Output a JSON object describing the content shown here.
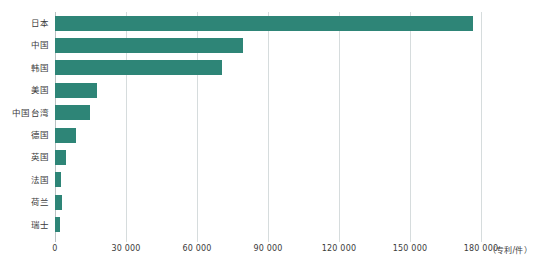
{
  "chart_data": {
    "type": "bar",
    "orientation": "horizontal",
    "title": "",
    "xlabel": "",
    "ylabel": "",
    "unit_label": "（专利/件）",
    "xlim": [
      0,
      180000
    ],
    "grid": true,
    "legend": false,
    "bar_color": "#2e8577",
    "gridline_color": "#d6dcdd",
    "axis_color": "#b9c1c2",
    "text_color": "#3b3b3b",
    "xticks": [
      0,
      30000,
      60000,
      90000,
      120000,
      150000,
      180000
    ],
    "xtick_labels": [
      "0",
      "30 000",
      "60 000",
      "90 000",
      "120 000",
      "150 000",
      "180 000"
    ],
    "categories": [
      "日本",
      "中国",
      "韩国",
      "美国",
      "中国台湾",
      "德国",
      "英国",
      "法国",
      "荷兰",
      "瑞士"
    ],
    "values": [
      176600,
      79400,
      70500,
      17700,
      14800,
      8900,
      4600,
      2500,
      3000,
      2100
    ],
    "points": [
      {
        "category": "日本",
        "value": 176600
      },
      {
        "category": "中国",
        "value": 79400
      },
      {
        "category": "韩国",
        "value": 70500
      },
      {
        "category": "美国",
        "value": 17700
      },
      {
        "category": "中国台湾",
        "value": 14800
      },
      {
        "category": "德国",
        "value": 8900
      },
      {
        "category": "英国",
        "value": 4600
      },
      {
        "category": "法国",
        "value": 2500
      },
      {
        "category": "荷兰",
        "value": 3000
      },
      {
        "category": "瑞士",
        "value": 2100
      }
    ]
  }
}
